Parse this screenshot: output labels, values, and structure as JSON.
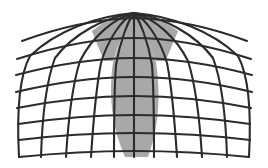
{
  "figure": {
    "background_color": "#ffffff",
    "line_color": "#2b2b2b",
    "sector_color": "#a8a8a8",
    "canvas": {
      "width": 268,
      "height": 168
    }
  },
  "geometry": {
    "apex": {
      "x": 134,
      "y": 13
    },
    "base": {
      "y_front": 157,
      "y_back": 148,
      "left_x": 19,
      "right_x": 249
    },
    "meridian_count": 11,
    "latitude_count": 8,
    "meridian_base_x": [
      19,
      41,
      66,
      91,
      114,
      134,
      154,
      177,
      202,
      227,
      249
    ],
    "latitude_front_y": [
      41,
      59,
      75,
      92,
      108,
      124,
      140,
      157
    ],
    "latitude_back_y": [
      31,
      50,
      67,
      84,
      100,
      116,
      132,
      148
    ],
    "latitude_half_width": [
      112,
      117,
      118,
      118,
      117,
      116,
      115,
      115
    ]
  },
  "sector": {
    "name": "highlighted-wedge",
    "color": "#a8a8a8",
    "apex_x": 134,
    "apex_y": 13,
    "top_left_x": 92,
    "top_right_x": 178,
    "bottom_left_x": 125,
    "bottom_right_x": 148,
    "bottom_y": 157
  },
  "labels": {
    "figure_caption": "",
    "axis_labels": [],
    "legend": []
  }
}
